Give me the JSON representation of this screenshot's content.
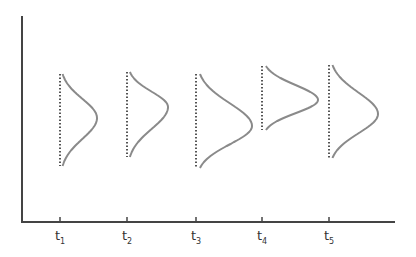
{
  "diagram": {
    "type": "distributions-over-time",
    "axis_color": "#444444",
    "curve_color": "#8a8a8a",
    "dotted_color": "#555555",
    "time_points": [
      {
        "label": "t",
        "sub": "1",
        "x": 60,
        "top": 74,
        "bottom": 166,
        "peak_x": 97,
        "peak_y": 118
      },
      {
        "label": "t",
        "sub": "2",
        "x": 127,
        "top": 72,
        "bottom": 157,
        "peak_x": 168,
        "peak_y": 107
      },
      {
        "label": "t",
        "sub": "3",
        "x": 196,
        "top": 74,
        "bottom": 168,
        "peak_x": 252,
        "peak_y": 126
      },
      {
        "label": "t",
        "sub": "4",
        "x": 262,
        "top": 66,
        "bottom": 130,
        "peak_x": 318,
        "peak_y": 100
      },
      {
        "label": "t",
        "sub": "5",
        "x": 329,
        "top": 65,
        "bottom": 158,
        "peak_x": 378,
        "peak_y": 114
      }
    ]
  }
}
